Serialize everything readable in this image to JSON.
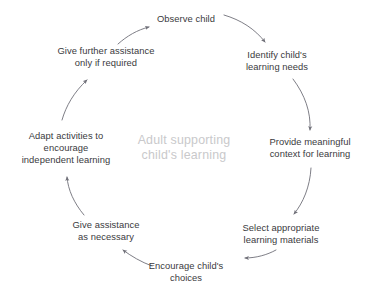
{
  "diagram": {
    "type": "cycle",
    "title_center": {
      "lines": [
        "Adult supporting",
        "child's learning"
      ],
      "color": "#c9c9cb",
      "x": 184,
      "y": 148
    },
    "text_color": "#3a3a40",
    "arrow_color": "#6f6f78",
    "background": "#ffffff",
    "nodes": [
      {
        "id": "observe-child",
        "lines": [
          "Observe child"
        ],
        "x": 186,
        "y": 19
      },
      {
        "id": "identify-learning-needs",
        "lines": [
          "Identify child's",
          "learning needs"
        ],
        "x": 277,
        "y": 61
      },
      {
        "id": "provide-meaningful-context",
        "lines": [
          "Provide meaningful",
          "context for learning"
        ],
        "x": 310,
        "y": 148
      },
      {
        "id": "select-learning-materials",
        "lines": [
          "Select appropriate",
          "learning materials"
        ],
        "x": 281,
        "y": 234
      },
      {
        "id": "encourage-childs-choices",
        "lines": [
          "Encourage child's",
          "choices"
        ],
        "x": 186,
        "y": 272
      },
      {
        "id": "give-assistance-as-necessary",
        "lines": [
          "Give assistance",
          "as necessary"
        ],
        "x": 106,
        "y": 231
      },
      {
        "id": "adapt-activities",
        "lines": [
          "Adapt activities to",
          "encourage",
          "independent learning"
        ],
        "x": 66,
        "y": 148
      },
      {
        "id": "give-further-assistance",
        "lines": [
          "Give further assistance",
          "only if required"
        ],
        "x": 106,
        "y": 57
      }
    ],
    "arrows": [
      {
        "id": "arrow-observe-to-identify",
        "from": "observe-child",
        "to": "identify-learning-needs"
      },
      {
        "id": "arrow-identify-to-provide",
        "from": "identify-learning-needs",
        "to": "provide-meaningful-context"
      },
      {
        "id": "arrow-provide-to-select",
        "from": "provide-meaningful-context",
        "to": "select-learning-materials"
      },
      {
        "id": "arrow-select-to-encourage",
        "from": "select-learning-materials",
        "to": "encourage-childs-choices"
      },
      {
        "id": "arrow-encourage-to-assistance",
        "from": "encourage-childs-choices",
        "to": "give-assistance-as-necessary"
      },
      {
        "id": "arrow-assistance-to-adapt",
        "from": "give-assistance-as-necessary",
        "to": "adapt-activities"
      },
      {
        "id": "arrow-adapt-to-further",
        "from": "adapt-activities",
        "to": "give-further-assistance"
      },
      {
        "id": "arrow-further-to-observe",
        "from": "give-further-assistance",
        "to": "observe-child"
      }
    ]
  }
}
